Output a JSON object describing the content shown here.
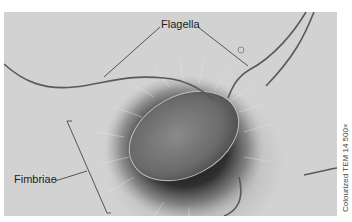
{
  "figure": {
    "labels": {
      "flagella": "Flagella",
      "fimbriae": "Fimbriae"
    },
    "caption": "Colourized TEM 14 500×",
    "colors": {
      "background": "#ffffff",
      "photo_light": "#d2d2d2",
      "photo_dark": "#2a2a2a",
      "label_text": "#222222",
      "leader_lines": "#333333"
    }
  }
}
